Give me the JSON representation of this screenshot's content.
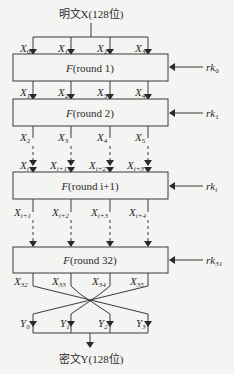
{
  "diagram": {
    "title_top": "明文X(128位)",
    "title_bottom": "密文Y(128位)",
    "rounds": [
      {
        "label_prefix": "F",
        "label_text": "(round 1)",
        "key": "rk",
        "key_sub": "0",
        "inputs": [
          {
            "v": "X",
            "s": "0"
          },
          {
            "v": "X",
            "s": "1"
          },
          {
            "v": "X",
            "s": "2"
          },
          {
            "v": "X",
            "s": "3"
          }
        ]
      },
      {
        "label_prefix": "F",
        "label_text": "(round 2)",
        "key": "rk",
        "key_sub": "1",
        "inputs": [
          {
            "v": "X",
            "s": "1"
          },
          {
            "v": "X",
            "s": "2"
          },
          {
            "v": "X",
            "s": "3"
          },
          {
            "v": "X",
            "s": "4"
          }
        ]
      },
      {
        "label_prefix": "F",
        "label_text": "(round i+1)",
        "key": "rk",
        "key_sub": "i",
        "inputs": [
          {
            "v": "X",
            "s": "i"
          },
          {
            "v": "X",
            "s": "i+1"
          },
          {
            "v": "X",
            "s": "i+2"
          },
          {
            "v": "X",
            "s": "i+3"
          }
        ]
      },
      {
        "label_prefix": "F",
        "label_text": "(round 32)",
        "key": "rk",
        "key_sub": "31",
        "inputs": []
      }
    ],
    "after_round2": [
      {
        "v": "X",
        "s": "2"
      },
      {
        "v": "X",
        "s": "3"
      },
      {
        "v": "X",
        "s": "4"
      },
      {
        "v": "X",
        "s": "5"
      }
    ],
    "after_round_i": [
      {
        "v": "X",
        "s": "i+1"
      },
      {
        "v": "X",
        "s": "i+2"
      },
      {
        "v": "X",
        "s": "i+3"
      },
      {
        "v": "X",
        "s": "i+4"
      }
    ],
    "after_round32": [
      {
        "v": "X",
        "s": "32"
      },
      {
        "v": "X",
        "s": "33"
      },
      {
        "v": "X",
        "s": "34"
      },
      {
        "v": "X",
        "s": "35"
      }
    ],
    "outputs": [
      {
        "v": "Y",
        "s": "0"
      },
      {
        "v": "Y",
        "s": "1"
      },
      {
        "v": "Y",
        "s": "2"
      },
      {
        "v": "Y",
        "s": "3"
      }
    ]
  }
}
